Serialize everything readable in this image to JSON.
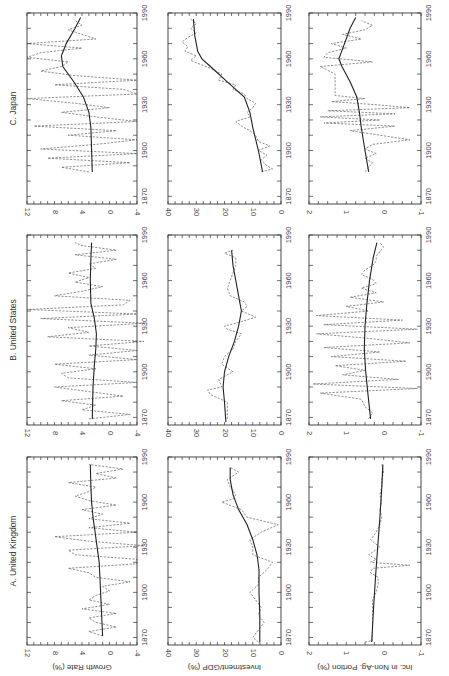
{
  "figure": {
    "orientation": "rotated-90-ccw",
    "panel_titles": [
      "A. United Kingdom",
      "B. United States",
      "C. Japan"
    ],
    "row_titles": [
      "Growth Rate (%)",
      "Investment/GDP (%)",
      "Inc. in Non-Ag. Portion (%)"
    ],
    "x_ticks": [
      "1870",
      "1900",
      "1930",
      "1960",
      "1990"
    ]
  },
  "chart_data": [
    {
      "type": "line",
      "title": "A. United Kingdom",
      "ylabel": "Growth Rate (%)",
      "xlabel": "",
      "xlim": [
        1865,
        1990
      ],
      "ylim": [
        -4,
        12
      ],
      "yticks": [
        -4,
        0,
        4,
        8,
        12
      ],
      "xticks": [
        1870,
        1900,
        1930,
        1960,
        1990
      ],
      "series": [
        {
          "name": "annual",
          "style": "dashed",
          "x": [
            1871,
            1874,
            1877,
            1880,
            1883,
            1886,
            1889,
            1892,
            1895,
            1898,
            1901,
            1904,
            1907,
            1910,
            1913,
            1916,
            1919,
            1922,
            1925,
            1928,
            1931,
            1934,
            1937,
            1940,
            1943,
            1946,
            1949,
            1952,
            1955,
            1958,
            1961,
            1964,
            1967,
            1970,
            1973,
            1976,
            1979,
            1982,
            1985
          ],
          "y": [
            1,
            3,
            -1,
            2,
            3,
            -1,
            4,
            0,
            3,
            2,
            0,
            1,
            -3,
            2,
            3,
            6,
            -4,
            -4,
            5,
            6,
            -5,
            3,
            8,
            -4,
            3,
            -3,
            3,
            1,
            4,
            -1,
            3,
            5,
            3,
            2,
            6,
            -1,
            2,
            -2,
            3
          ]
        },
        {
          "name": "trend",
          "style": "solid",
          "x": [
            1871,
            1890,
            1910,
            1920,
            1930,
            1940,
            1950,
            1960,
            1970,
            1985
          ],
          "y": [
            1.0,
            1.2,
            1.4,
            1.5,
            1.8,
            2.1,
            2.4,
            2.6,
            2.7,
            2.8
          ]
        }
      ]
    },
    {
      "type": "line",
      "title": "B. United States",
      "ylabel": "Growth Rate (%)",
      "xlim": [
        1865,
        1990
      ],
      "ylim": [
        -4,
        12
      ],
      "yticks": [
        -4,
        0,
        4,
        8,
        12
      ],
      "xticks": [
        1870,
        1900,
        1930,
        1960,
        1990
      ],
      "series": [
        {
          "name": "annual",
          "style": "dashed",
          "x": [
            1869,
            1872,
            1875,
            1878,
            1881,
            1884,
            1887,
            1890,
            1893,
            1896,
            1899,
            1902,
            1905,
            1908,
            1911,
            1914,
            1917,
            1920,
            1923,
            1926,
            1929,
            1932,
            1935,
            1938,
            1941,
            1944,
            1947,
            1950,
            1953,
            1956,
            1959,
            1962,
            1965,
            1968,
            1971,
            1974,
            1977,
            1980,
            1983,
            1985
          ],
          "y": [
            3,
            -3,
            4,
            2,
            7,
            -2,
            3,
            8,
            -4,
            6,
            7,
            2,
            8,
            -4,
            3,
            -4,
            3,
            -5,
            9,
            3,
            6,
            -5,
            10,
            -4,
            12,
            -2,
            -3,
            8,
            4,
            1,
            5,
            3,
            6,
            2,
            3,
            -1,
            5,
            -1,
            4,
            5
          ]
        },
        {
          "name": "trend",
          "style": "solid",
          "x": [
            1869,
            1890,
            1905,
            1915,
            1925,
            1935,
            1945,
            1960,
            1975,
            1985
          ],
          "y": [
            2.5,
            2.4,
            2.2,
            2.0,
            1.9,
            2.2,
            2.7,
            2.8,
            2.7,
            2.6
          ]
        }
      ]
    },
    {
      "type": "line",
      "title": "C. Japan",
      "ylabel": "Growth Rate (%)",
      "xlim": [
        1865,
        1990
      ],
      "ylim": [
        -4,
        12
      ],
      "yticks": [
        -4,
        0,
        4,
        8,
        12
      ],
      "xticks": [
        1870,
        1900,
        1930,
        1960,
        1990
      ],
      "series": [
        {
          "name": "annual",
          "style": "dashed",
          "x": [
            1886,
            1889,
            1892,
            1895,
            1898,
            1901,
            1904,
            1907,
            1910,
            1913,
            1916,
            1919,
            1922,
            1925,
            1928,
            1931,
            1934,
            1937,
            1940,
            1943,
            1946,
            1949,
            1952,
            1955,
            1958,
            1961,
            1964,
            1967,
            1970,
            1973,
            1976,
            1979,
            1982,
            1985
          ],
          "y": [
            3,
            7,
            -3,
            9,
            -4,
            10,
            2,
            -4,
            6,
            -1,
            11,
            -4,
            2,
            7,
            0,
            5,
            12,
            -4,
            -2,
            8,
            -4,
            5,
            10,
            7,
            6,
            12,
            10,
            4,
            12,
            2,
            4,
            6,
            4,
            5
          ]
        },
        {
          "name": "trend",
          "style": "solid",
          "x": [
            1886,
            1900,
            1915,
            1925,
            1935,
            1945,
            1955,
            1962,
            1970,
            1980,
            1987
          ],
          "y": [
            2.5,
            2.6,
            2.7,
            3.0,
            3.8,
            5.2,
            6.8,
            7.0,
            6.3,
            5.0,
            4.2
          ]
        }
      ]
    },
    {
      "type": "line",
      "title": "A. United Kingdom",
      "ylabel": "Investment/GDP (%)",
      "xlim": [
        1865,
        1990
      ],
      "ylim": [
        0,
        40
      ],
      "yticks": [
        0,
        10,
        20,
        30,
        40
      ],
      "xticks": [
        1870,
        1900,
        1930,
        1960,
        1990
      ],
      "series": [
        {
          "name": "annual",
          "style": "dashed",
          "x": [
            1867,
            1870,
            1875,
            1880,
            1885,
            1890,
            1895,
            1900,
            1905,
            1910,
            1915,
            1920,
            1925,
            1930,
            1935,
            1940,
            1945,
            1950,
            1955,
            1960,
            1962,
            1965,
            1970,
            1975,
            1980,
            1983
          ],
          "y": [
            8,
            10,
            8,
            6,
            8,
            7,
            9,
            11,
            8,
            8,
            5,
            3,
            10,
            10,
            11,
            7,
            1,
            12,
            14,
            21,
            17,
            16,
            18,
            19,
            15,
            18
          ]
        },
        {
          "name": "trend",
          "style": "solid",
          "x": [
            1867,
            1885,
            1900,
            1915,
            1925,
            1935,
            1945,
            1955,
            1965,
            1975,
            1983
          ],
          "y": [
            7.5,
            7.5,
            7.8,
            7.8,
            8.5,
            10,
            12,
            15,
            17,
            18,
            18
          ]
        }
      ]
    },
    {
      "type": "line",
      "title": "B. United States",
      "ylabel": "Investment/GDP (%)",
      "xlim": [
        1865,
        1990
      ],
      "ylim": [
        0,
        40
      ],
      "yticks": [
        0,
        10,
        20,
        30,
        40
      ],
      "xticks": [
        1870,
        1900,
        1930,
        1960,
        1990
      ],
      "series": [
        {
          "name": "annual",
          "style": "dashed",
          "x": [
            1869,
            1875,
            1880,
            1885,
            1888,
            1890,
            1895,
            1900,
            1905,
            1910,
            1915,
            1920,
            1925,
            1928,
            1930,
            1933,
            1936,
            1940,
            1943,
            1946,
            1950,
            1955,
            1960,
            1965,
            1970,
            1975,
            1978,
            1980
          ],
          "y": [
            19,
            19,
            19,
            25,
            26,
            21,
            22,
            17,
            21,
            20,
            17,
            16,
            14,
            19,
            20,
            14,
            9,
            14,
            12,
            13,
            18,
            19,
            18,
            17,
            16,
            16,
            20,
            17
          ]
        },
        {
          "name": "trend",
          "style": "solid",
          "x": [
            1867,
            1880,
            1890,
            1900,
            1910,
            1920,
            1930,
            1940,
            1950,
            1960,
            1970,
            1980
          ],
          "y": [
            19.5,
            20,
            20.5,
            20,
            18.5,
            16.5,
            15,
            14,
            15,
            16,
            17,
            17.5
          ]
        }
      ]
    },
    {
      "type": "line",
      "title": "C. Japan",
      "ylabel": "Investment/GDP (%)",
      "xlim": [
        1865,
        1990
      ],
      "ylim": [
        0,
        40
      ],
      "yticks": [
        0,
        10,
        20,
        30,
        40
      ],
      "xticks": [
        1870,
        1900,
        1930,
        1960,
        1990
      ],
      "series": [
        {
          "name": "annual",
          "style": "dashed",
          "x": [
            1886,
            1888,
            1890,
            1894,
            1897,
            1900,
            1903,
            1906,
            1910,
            1913,
            1916,
            1919,
            1922,
            1925,
            1928,
            1931,
            1934,
            1937,
            1940,
            1943,
            1946,
            1950,
            1953,
            1956,
            1959,
            1962,
            1965,
            1968,
            1971,
            1974,
            1977,
            1980,
            1983,
            1986
          ],
          "y": [
            7,
            3,
            5,
            7,
            5,
            8,
            4,
            8,
            9,
            11,
            14,
            16,
            11,
            12,
            10,
            9,
            12,
            13,
            17,
            16,
            22,
            21,
            24,
            28,
            32,
            30,
            34,
            33,
            35,
            33,
            30,
            32,
            30,
            32
          ]
        },
        {
          "name": "trend",
          "style": "solid",
          "x": [
            1886,
            1900,
            1915,
            1925,
            1935,
            1945,
            1955,
            1960,
            1965,
            1975,
            1986
          ],
          "y": [
            6.5,
            8,
            10,
            11,
            13,
            19,
            25,
            28,
            29.5,
            30.5,
            31
          ]
        }
      ]
    },
    {
      "type": "line",
      "title": "A. United Kingdom",
      "ylabel": "Inc. in Non-Ag. Portion (%)",
      "xlim": [
        1865,
        1990
      ],
      "ylim": [
        -1,
        2
      ],
      "yticks": [
        -1,
        0,
        1,
        2
      ],
      "xticks": [
        1870,
        1900,
        1930,
        1960,
        1990
      ],
      "series": [
        {
          "name": "annual",
          "style": "dashed",
          "x": [
            1867,
            1868,
            1875,
            1885,
            1895,
            1900,
            1905,
            1910,
            1913,
            1916,
            1918,
            1920,
            1922,
            1925,
            1930,
            1935,
            1940,
            1945,
            1950,
            1955,
            1960,
            1965,
            1970,
            1975,
            1980,
            1985
          ],
          "y": [
            0.5,
            0.3,
            0.3,
            0.3,
            0.3,
            0.2,
            0.15,
            0.15,
            0.35,
            0.3,
            -0.7,
            0.35,
            0.2,
            0.4,
            0.1,
            0.35,
            0.2,
            0.1,
            0.05,
            0.1,
            0.05,
            0.1,
            0.05,
            0.05,
            0.0,
            0.05
          ]
        },
        {
          "name": "trend",
          "style": "solid",
          "x": [
            1867,
            1890,
            1910,
            1930,
            1950,
            1970,
            1985
          ],
          "y": [
            0.32,
            0.27,
            0.22,
            0.16,
            0.1,
            0.05,
            0.02
          ]
        }
      ]
    },
    {
      "type": "line",
      "title": "B. United States",
      "ylabel": "Inc. in Non-Ag. Portion (%)",
      "xlim": [
        1865,
        1990
      ],
      "ylim": [
        -1,
        2
      ],
      "yticks": [
        -1,
        0,
        1,
        2
      ],
      "xticks": [
        1870,
        1900,
        1930,
        1960,
        1990
      ],
      "series": [
        {
          "name": "annual",
          "style": "dashed",
          "x": [
            1869,
            1873,
            1877,
            1882,
            1886,
            1889,
            1892,
            1895,
            1898,
            1901,
            1904,
            1907,
            1910,
            1913,
            1916,
            1919,
            1922,
            1925,
            1928,
            1931,
            1934,
            1937,
            1940,
            1943,
            1946,
            1949,
            1952,
            1955,
            1958,
            1961,
            1964,
            1967,
            1970,
            1973,
            1976,
            1979,
            1982,
            1985
          ],
          "y": [
            0.4,
            0.3,
            0.5,
            0.6,
            1.7,
            -0.9,
            1.9,
            -0.4,
            1.1,
            0.5,
            1.3,
            -0.6,
            1.4,
            0.1,
            1.6,
            -0.7,
            0.4,
            1.8,
            -0.9,
            1.6,
            -0.5,
            1.8,
            0.4,
            1.0,
            0.0,
            0.9,
            0.2,
            0.6,
            0.2,
            0.3,
            0.6,
            0.5,
            0.3,
            0.2,
            0.2,
            0.1,
            0.0,
            0.1
          ]
        },
        {
          "name": "trend",
          "style": "solid",
          "x": [
            1869,
            1885,
            1900,
            1915,
            1930,
            1945,
            1960,
            1975,
            1985
          ],
          "y": [
            0.35,
            0.42,
            0.48,
            0.52,
            0.5,
            0.45,
            0.38,
            0.28,
            0.18
          ]
        }
      ]
    },
    {
      "type": "line",
      "title": "C. Japan",
      "ylabel": "Inc. in Non-Ag. Portion (%)",
      "xlim": [
        1865,
        1990
      ],
      "ylim": [
        -1,
        2
      ],
      "yticks": [
        -1,
        0,
        1,
        2
      ],
      "xticks": [
        1870,
        1900,
        1930,
        1960,
        1990
      ],
      "series": [
        {
          "name": "annual",
          "style": "dashed",
          "x": [
            1886,
            1889,
            1892,
            1895,
            1898,
            1901,
            1904,
            1907,
            1910,
            1913,
            1916,
            1918,
            1920,
            1922,
            1924,
            1926,
            1928,
            1930,
            1932,
            1934,
            1936,
            1940,
            1945,
            1950,
            1955,
            1958,
            1961,
            1964,
            1967,
            1970,
            1973,
            1976,
            1979,
            1982,
            1985
          ],
          "y": [
            0.5,
            0.4,
            0.3,
            0.5,
            0.2,
            0.5,
            0.3,
            -0.7,
            0.1,
            0.9,
            -0.3,
            1.6,
            0.1,
            1.7,
            -0.3,
            1.5,
            -0.7,
            0.2,
            1.4,
            0.5,
            1.3,
            1.3,
            1.3,
            1.3,
            1.7,
            0.3,
            1.6,
            1.5,
            1.0,
            1.4,
            0.6,
            1.1,
            0.5,
            0.3,
            0.6
          ]
        },
        {
          "name": "trend",
          "style": "solid",
          "x": [
            1886,
            1900,
            1915,
            1925,
            1935,
            1945,
            1955,
            1960,
            1970,
            1980,
            1987
          ],
          "y": [
            0.4,
            0.5,
            0.6,
            0.65,
            0.72,
            0.9,
            1.12,
            1.2,
            1.05,
            0.9,
            0.75
          ]
        }
      ]
    }
  ]
}
